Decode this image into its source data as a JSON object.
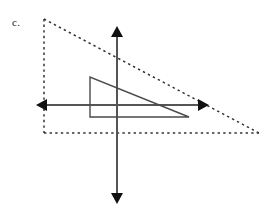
{
  "figure": {
    "part_label": "c.",
    "label_position": {
      "x": 12,
      "y": 16
    },
    "canvas": {
      "width": 274,
      "height": 212,
      "background": "#ffffff"
    },
    "colors": {
      "axis_stroke": "#555555",
      "solid_shape_stroke": "#4a4a4a",
      "dashed_shape_stroke": "#333333",
      "arrowhead_fill": "#111111",
      "label_text": "#1a1a1a"
    },
    "axes": {
      "name": "coordinate-axes",
      "origin": {
        "x": 117,
        "y": 105
      },
      "stroke_width": 2,
      "horizontal": {
        "name": "x-axis",
        "x1": 42,
        "y1": 105,
        "x2": 203,
        "y2": 105,
        "arrow_left": {
          "tip_x": 36,
          "tip_y": 105
        },
        "arrow_right": {
          "tip_x": 209,
          "tip_y": 105
        }
      },
      "vertical": {
        "name": "y-axis",
        "x1": 117,
        "y1": 34,
        "x2": 117,
        "y2": 196,
        "arrow_up": {
          "tip_x": 117,
          "tip_y": 26
        },
        "arrow_down": {
          "tip_x": 117,
          "tip_y": 204
        }
      }
    },
    "solid_triangle": {
      "name": "pre-image-triangle",
      "style": "solid",
      "stroke_width": 1.4,
      "vertices": [
        {
          "x": 90,
          "y": 77
        },
        {
          "x": 90,
          "y": 117
        },
        {
          "x": 189,
          "y": 117
        }
      ],
      "hypotenuse": {
        "from": {
          "x": 90,
          "y": 77
        },
        "to": {
          "x": 189,
          "y": 117
        }
      }
    },
    "dashed_triangle": {
      "name": "image-triangle",
      "style": "dashed",
      "stroke_width": 1.5,
      "dash_pattern": "2.4 3.2",
      "vertices": [
        {
          "x": 44,
          "y": 19
        },
        {
          "x": 44,
          "y": 133
        },
        {
          "x": 259,
          "y": 133
        }
      ],
      "hypotenuse": {
        "from": {
          "x": 44,
          "y": 19
        },
        "to": {
          "x": 259,
          "y": 133
        }
      }
    }
  }
}
